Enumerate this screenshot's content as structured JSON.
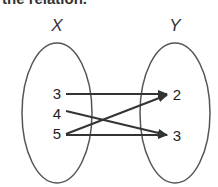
{
  "caption": "the relation.",
  "diagram": {
    "type": "mapping-diagram",
    "colors": {
      "stroke": "#444444",
      "text": "#222222"
    },
    "domain": {
      "label": "X",
      "elements": [
        "3",
        "4",
        "5"
      ]
    },
    "range": {
      "label": "Y",
      "elements": [
        "2",
        "3"
      ]
    },
    "mappings": [
      {
        "from": "3",
        "to": "2"
      },
      {
        "from": "4",
        "to": "3"
      },
      {
        "from": "5",
        "to": "2"
      },
      {
        "from": "5",
        "to": "3"
      }
    ]
  }
}
